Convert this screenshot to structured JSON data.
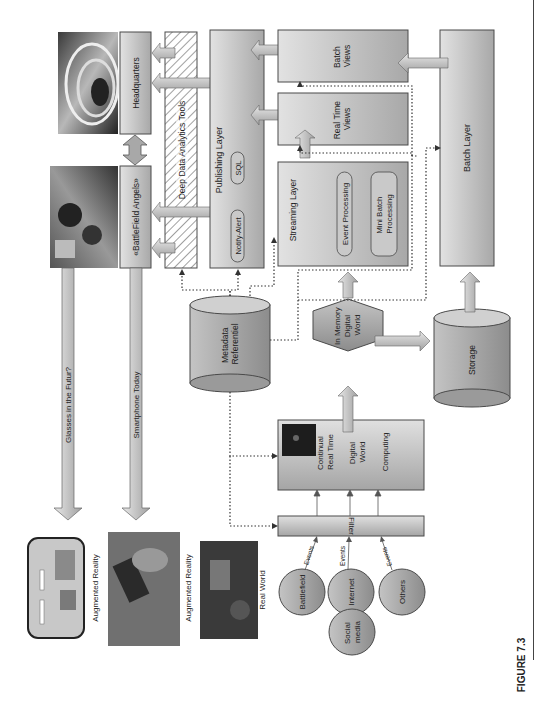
{
  "figure": {
    "caption": "FIGURE 7.3",
    "orientation": "rotated 90° counter-clockwise (text reads bottom-to-top)"
  },
  "colors": {
    "box_fill_light": "#d8d8d8",
    "box_fill_dark": "#9a9a9a",
    "box_stroke": "#4a4a4a",
    "arrow_fill": "#c8c8c8",
    "dotted_line": "#333333",
    "hatch": "#777777"
  },
  "outputs": {
    "headquarters": "Headquarters",
    "battlefield_angels": "«BattleField Angels»",
    "glasses_arrow": "Glasses in the Futur?",
    "smartphone_arrow": "Smartphone Today",
    "ar_glasses_label": "Augmented Reality",
    "ar_smartphone_label": "Augmented Reality",
    "real_world_label": "Real World"
  },
  "layers": {
    "deep_analytics": "Deep Data Analytics Tools",
    "publishing": {
      "title": "Publishing Layer",
      "pills": [
        "SQL",
        "Notify-Alert"
      ]
    },
    "batch_views": [
      "Batch",
      "Views"
    ],
    "real_time_views": [
      "Real Time",
      "Views"
    ],
    "streaming": {
      "title": "Streaming Layer",
      "pills": [
        [
          "Event Processing"
        ],
        [
          "Mini Batch",
          "Processing"
        ]
      ]
    },
    "batch_layer": "Batch Layer"
  },
  "stores": {
    "metadata": [
      "Metadata",
      "Referentiel"
    ],
    "in_memory": [
      "In Memory",
      "Digital",
      "World"
    ],
    "storage": "Storage"
  },
  "ingest": {
    "continual": {
      "lines": [
        "Continual",
        "Real Time"
      ],
      "digital_world": [
        "Digital",
        "World"
      ],
      "computing": "Computing"
    },
    "filter": "Filter",
    "sources": [
      "Battlefield",
      "Internet",
      "Others",
      "Social media"
    ],
    "event_label": "Events"
  }
}
